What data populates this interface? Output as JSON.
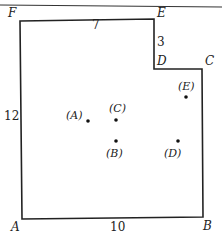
{
  "figure": {
    "stroke_color": "#222222",
    "vertices": [
      {
        "name": "F",
        "x": 20,
        "y": 21,
        "lx": 8,
        "ly": 17
      },
      {
        "name": "E",
        "x": 154,
        "y": 19,
        "lx": 157,
        "ly": 17
      },
      {
        "name": "D",
        "x": 154,
        "y": 69,
        "lx": 157,
        "ly": 65
      },
      {
        "name": "C",
        "x": 202,
        "y": 69,
        "lx": 205,
        "ly": 65
      },
      {
        "name": "B",
        "x": 203,
        "y": 217,
        "lx": 203,
        "ly": 230
      },
      {
        "name": "A",
        "x": 22,
        "y": 219,
        "lx": 11,
        "ly": 231
      }
    ],
    "side_labels": [
      {
        "text": "7",
        "x": 92,
        "y": 29
      },
      {
        "text": "3",
        "x": 157,
        "y": 46
      },
      {
        "text": "12",
        "x": 4,
        "y": 120
      },
      {
        "text": "10",
        "x": 110,
        "y": 231
      }
    ],
    "points": [
      {
        "label": "(A)",
        "dot_x": 88,
        "dot_y": 121,
        "label_x": 66,
        "label_y": 119
      },
      {
        "label": "(C)",
        "dot_x": 116,
        "dot_y": 120,
        "label_x": 109,
        "label_y": 112
      },
      {
        "label": "(B)",
        "dot_x": 116,
        "dot_y": 141,
        "label_x": 106,
        "label_y": 157
      },
      {
        "label": "(D)",
        "dot_x": 178,
        "dot_y": 141,
        "label_x": 164,
        "label_y": 157
      },
      {
        "label": "(E)",
        "dot_x": 186,
        "dot_y": 97,
        "label_x": 178,
        "label_y": 90
      }
    ]
  }
}
